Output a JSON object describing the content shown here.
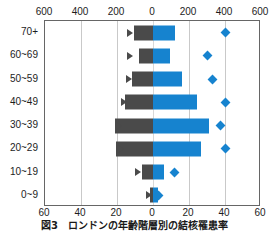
{
  "caption": "図3　ロンドンの年齢階層別の結核罹患率",
  "chart_data": {
    "type": "bar",
    "title": "",
    "subtitle": "",
    "orientation": "horizontal-diverging",
    "categories": [
      "70+",
      "60~69",
      "50~59",
      "40~49",
      "30~39",
      "20~29",
      "10~19",
      "0~9"
    ],
    "xlabel": "",
    "ylabel": "",
    "grid": true,
    "legend": [],
    "axes": [
      {
        "name": "top-axis",
        "position": "top",
        "ticks": [
          600,
          400,
          200,
          0,
          200,
          400,
          600
        ],
        "tick_labels": [
          "600",
          "400",
          "200",
          "0",
          "200",
          "400",
          "600"
        ],
        "range": [
          -600,
          600
        ],
        "applies_to": [
          "count-left-triangle",
          "count-right-diamond"
        ]
      },
      {
        "name": "bottom-axis",
        "position": "bottom",
        "ticks": [
          60,
          40,
          20,
          0,
          20,
          40,
          60
        ],
        "tick_labels": [
          "60",
          "40",
          "20",
          "0",
          "20",
          "40",
          "60"
        ],
        "range": [
          -60,
          60
        ],
        "applies_to": [
          "percent-left-bar",
          "percent-right-bar"
        ]
      }
    ],
    "series": [
      {
        "name": "percent-left-bar",
        "mark": "bar",
        "side": "left",
        "color": "#4a4a4a",
        "axis": "bottom-axis",
        "values": [
          10.5,
          8.0,
          11.5,
          15.5,
          21.0,
          20.5,
          6.0,
          1.5
        ]
      },
      {
        "name": "percent-right-bar",
        "mark": "bar",
        "side": "right",
        "color": "#1683cf",
        "axis": "bottom-axis",
        "values": [
          12.0,
          9.5,
          16.0,
          24.5,
          31.0,
          26.5,
          6.0,
          2.5
        ]
      },
      {
        "name": "count-left-triangle",
        "mark": "triangle",
        "side": "left",
        "color": "#4a4a4a",
        "axis": "top-axis",
        "values": [
          130,
          130,
          135,
          160,
          190,
          180,
          85,
          20
        ]
      },
      {
        "name": "count-right-diamond",
        "mark": "diamond",
        "side": "right",
        "color": "#1683cf",
        "axis": "top-axis",
        "values": [
          400,
          305,
          330,
          400,
          375,
          400,
          120,
          30
        ]
      }
    ]
  },
  "colors": {
    "left_bar": "#4a4a4a",
    "right_bar": "#1683cf",
    "grid": "#c9c9c9",
    "frame": "#666666"
  }
}
